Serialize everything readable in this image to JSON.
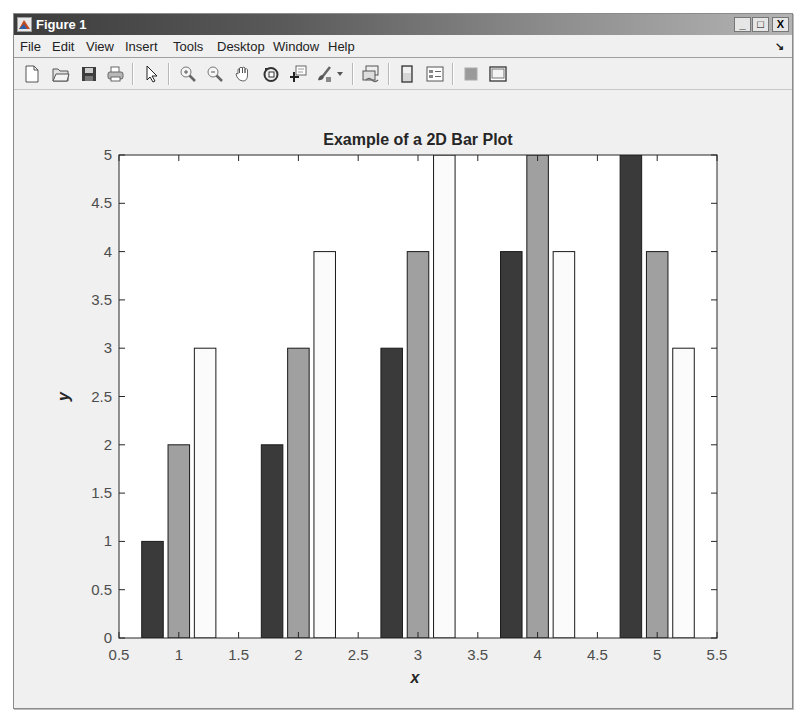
{
  "window": {
    "title": "Figure 1",
    "controls": {
      "minimize": "_",
      "maximize": "□",
      "close": "X"
    }
  },
  "menubar": {
    "items": [
      {
        "label": "File"
      },
      {
        "label": "Edit"
      },
      {
        "label": "View"
      },
      {
        "label": "Insert"
      },
      {
        "label": "Tools"
      },
      {
        "label": "Desktop"
      },
      {
        "label": "Window"
      },
      {
        "label": "Help"
      }
    ],
    "dock_arrow": "↘"
  },
  "toolbar": {
    "buttons": [
      {
        "name": "new-figure",
        "icon": "new-file-icon"
      },
      {
        "name": "open-file",
        "icon": "open-folder-icon"
      },
      {
        "name": "save-figure",
        "icon": "save-icon"
      },
      {
        "name": "print-figure",
        "icon": "print-icon"
      },
      {
        "name": "edit-plot",
        "icon": "pointer-arrow-icon"
      },
      {
        "name": "zoom-in",
        "icon": "zoom-in-icon"
      },
      {
        "name": "zoom-out",
        "icon": "zoom-out-icon"
      },
      {
        "name": "pan",
        "icon": "hand-pan-icon"
      },
      {
        "name": "rotate-3d",
        "icon": "rotate-3d-icon"
      },
      {
        "name": "data-cursor",
        "icon": "data-cursor-icon"
      },
      {
        "name": "brush",
        "icon": "brush-icon"
      },
      {
        "name": "brush-dropdown",
        "icon": "dropdown-arrow-icon"
      },
      {
        "name": "link-plot",
        "icon": "link-plot-icon"
      },
      {
        "name": "insert-colorbar",
        "icon": "colorbar-icon"
      },
      {
        "name": "insert-legend",
        "icon": "legend-icon"
      },
      {
        "name": "hide-plot-tools",
        "icon": "hide-plot-tools-icon"
      },
      {
        "name": "show-plot-tools",
        "icon": "show-plot-tools-icon"
      }
    ]
  },
  "colors": {
    "series1": "#3a3a3a",
    "series2": "#a0a0a0",
    "series3": "#fbfbfb",
    "axis": "#262626",
    "tick_label": "#4d4d4d"
  },
  "chart_data": {
    "type": "bar",
    "title": "Example of a 2D Bar Plot",
    "xlabel": "x",
    "ylabel": "y",
    "categories": [
      1,
      2,
      3,
      4,
      5
    ],
    "series": [
      {
        "name": "Series 1",
        "color": "#3a3a3a",
        "values": [
          1,
          2,
          3,
          4,
          5
        ]
      },
      {
        "name": "Series 2",
        "color": "#a0a0a0",
        "values": [
          2,
          3,
          4,
          5,
          4
        ]
      },
      {
        "name": "Series 3",
        "color": "#fbfbfb",
        "values": [
          3,
          4,
          5,
          4,
          3
        ]
      }
    ],
    "xlim": [
      0.5,
      5.5
    ],
    "ylim": [
      0,
      5
    ],
    "xticks": [
      "0.5",
      "1",
      "1.5",
      "2",
      "2.5",
      "3",
      "3.5",
      "4",
      "4.5",
      "5",
      "5.5"
    ],
    "yticks": [
      "0",
      "0.5",
      "1",
      "1.5",
      "2",
      "2.5",
      "3",
      "3.5",
      "4",
      "4.5",
      "5"
    ],
    "grid": false,
    "legend": null
  }
}
